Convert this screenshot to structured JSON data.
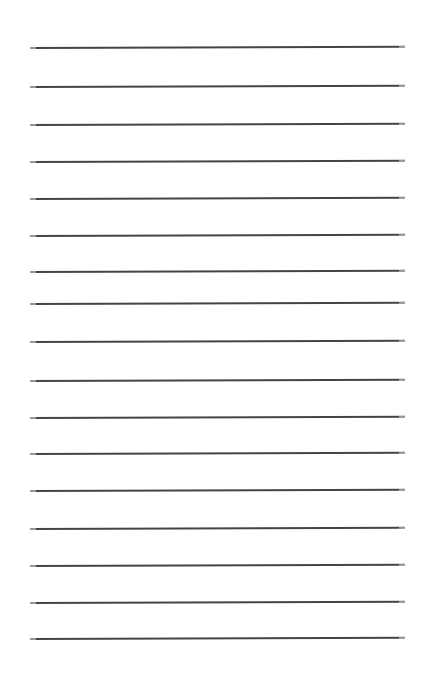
{
  "page": {
    "width": 422,
    "height": 685,
    "background_color": "#ffffff"
  },
  "ruling": {
    "kind": "horizontal-ruled-lines",
    "line_count": 17,
    "line_color": "#43434a",
    "line_thickness_px": 2,
    "line_start_x": 30,
    "line_end_x": 405,
    "line_length_px": 375,
    "first_line_y": 47,
    "last_line_y": 638,
    "line_spacing_px": 36.9,
    "tilt_degrees": -0.18,
    "end_cap_fade": true
  },
  "lines": [
    {
      "index": 1,
      "y": 47,
      "x1": 30,
      "x2": 405,
      "color": "#43434a",
      "thickness": 2
    },
    {
      "index": 2,
      "y": 86,
      "x1": 30,
      "x2": 405,
      "color": "#43434a",
      "thickness": 2
    },
    {
      "index": 3,
      "y": 124,
      "x1": 30,
      "x2": 405,
      "color": "#43434a",
      "thickness": 2
    },
    {
      "index": 4,
      "y": 161,
      "x1": 30,
      "x2": 405,
      "color": "#43434a",
      "thickness": 2
    },
    {
      "index": 5,
      "y": 198,
      "x1": 30,
      "x2": 405,
      "color": "#43434a",
      "thickness": 2
    },
    {
      "index": 6,
      "y": 235,
      "x1": 30,
      "x2": 405,
      "color": "#43434a",
      "thickness": 2
    },
    {
      "index": 7,
      "y": 271,
      "x1": 30,
      "x2": 405,
      "color": "#43434a",
      "thickness": 2
    },
    {
      "index": 8,
      "y": 303,
      "x1": 30,
      "x2": 405,
      "color": "#43434a",
      "thickness": 2
    },
    {
      "index": 9,
      "y": 341,
      "x1": 30,
      "x2": 405,
      "color": "#43434a",
      "thickness": 2
    },
    {
      "index": 10,
      "y": 380,
      "x1": 30,
      "x2": 405,
      "color": "#43434a",
      "thickness": 2
    },
    {
      "index": 11,
      "y": 417,
      "x1": 30,
      "x2": 405,
      "color": "#43434a",
      "thickness": 2
    },
    {
      "index": 12,
      "y": 453,
      "x1": 30,
      "x2": 405,
      "color": "#43434a",
      "thickness": 2
    },
    {
      "index": 13,
      "y": 490,
      "x1": 30,
      "x2": 405,
      "color": "#43434a",
      "thickness": 2
    },
    {
      "index": 14,
      "y": 528,
      "x1": 30,
      "x2": 405,
      "color": "#43434a",
      "thickness": 2
    },
    {
      "index": 15,
      "y": 565,
      "x1": 30,
      "x2": 405,
      "color": "#43434a",
      "thickness": 2
    },
    {
      "index": 16,
      "y": 602,
      "x1": 30,
      "x2": 405,
      "color": "#43434a",
      "thickness": 2
    },
    {
      "index": 17,
      "y": 638,
      "x1": 30,
      "x2": 405,
      "color": "#43434a",
      "thickness": 2
    }
  ]
}
